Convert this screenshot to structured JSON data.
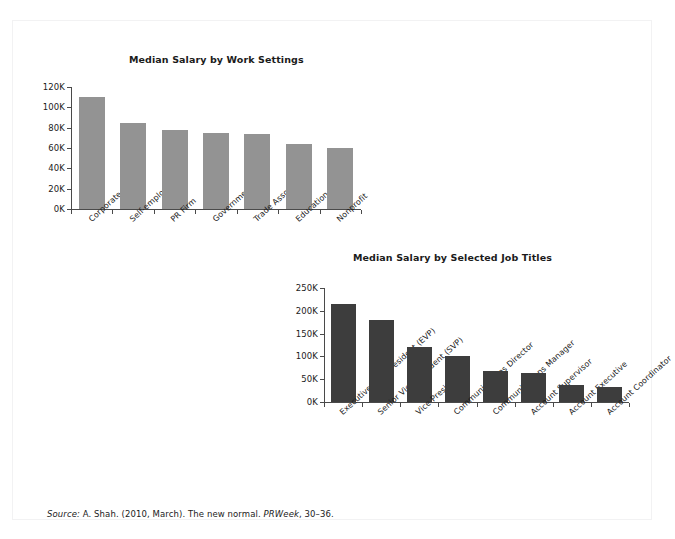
{
  "page": {
    "background_color": "#ffffff",
    "frame_border_color": "#f2f2f3",
    "header_artifact": "",
    "source_note": {
      "label": "Source:",
      "text_before_journal": " A. Shah. (2010, March). The new normal. ",
      "journal": "PRWeek",
      "text_after_journal": ", 30–36."
    }
  },
  "chart_data": [
    {
      "id": "chart1",
      "type": "bar",
      "title": "Median Salary by Work Settings",
      "xlabel": "",
      "ylabel": "",
      "ylim": [
        0,
        120000
      ],
      "ytick_labels": [
        "120K",
        "100K",
        "80K",
        "60K",
        "40K",
        "20K",
        "0K"
      ],
      "ytick_values": [
        120000,
        100000,
        80000,
        60000,
        40000,
        20000,
        0
      ],
      "grid": false,
      "legend": false,
      "bar_color": "#939393",
      "categories": [
        "Corporate",
        "Self-employed",
        "PR Firm",
        "Government",
        "Trade Association",
        "Education",
        "Nonprofit"
      ],
      "values": [
        110000,
        85000,
        78000,
        75000,
        74000,
        64000,
        60000
      ]
    },
    {
      "id": "chart2",
      "type": "bar",
      "title": "Median Salary by Selected Job Titles",
      "xlabel": "",
      "ylabel": "",
      "ylim": [
        0,
        250000
      ],
      "ytick_labels": [
        "250K",
        "200K",
        "150K",
        "100K",
        "50K",
        "0K"
      ],
      "ytick_values": [
        250000,
        200000,
        150000,
        100000,
        50000,
        0
      ],
      "grid": false,
      "legend": false,
      "bar_color": "#3d3d3d",
      "categories": [
        "Executive Vice President (EVP)",
        "Senior Vice President (SVP)",
        "Vice President",
        "Communications Director",
        "Communications Manager",
        "Account Supervisor",
        "Account Executive",
        "Account Coordinator"
      ],
      "values": [
        215000,
        180000,
        120000,
        100000,
        68000,
        63000,
        38000,
        33000
      ]
    }
  ]
}
